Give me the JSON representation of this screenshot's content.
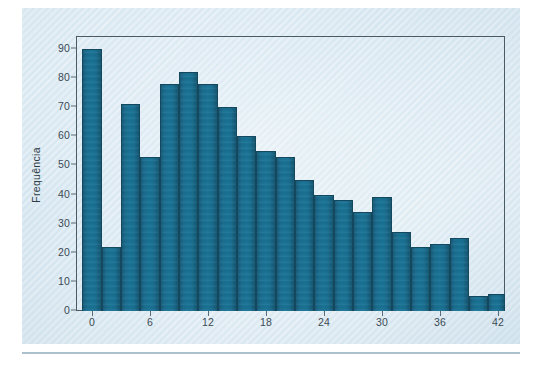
{
  "figure": {
    "background_color": "#e2edf4",
    "plot_border_color": "#4a5b66",
    "bar_color": "#1a7093",
    "bar_edge_color": "#14485e",
    "rule_line_color": "#9fb6c4"
  },
  "axes": {
    "y_axis_title": "Frequência",
    "y_ticks": [
      0,
      10,
      20,
      30,
      40,
      50,
      60,
      70,
      80,
      90
    ],
    "y_tick_labels": [
      "0",
      "10",
      "20",
      "30",
      "40",
      "50",
      "60",
      "70",
      "80",
      "90"
    ],
    "x_ticks": [
      0,
      6,
      12,
      18,
      24,
      30,
      36,
      42
    ],
    "x_tick_labels": [
      "0",
      "6",
      "12",
      "18",
      "24",
      "30",
      "36",
      "42"
    ]
  },
  "chart_data": {
    "type": "bar",
    "title": "",
    "subtitle": "",
    "xlabel": "",
    "ylabel": "Frequência",
    "xlim": [
      -1,
      45
    ],
    "ylim": [
      0,
      95
    ],
    "bin_width": 2,
    "grid": false,
    "legend": null,
    "categories": [
      "-1",
      "1",
      "3",
      "5",
      "7",
      "9",
      "11",
      "13",
      "15",
      "17",
      "19",
      "21",
      "23",
      "25",
      "27",
      "29",
      "31",
      "33",
      "35",
      "37",
      "39",
      "41",
      "43"
    ],
    "bin_starts": [
      -1,
      1,
      3,
      5,
      7,
      9,
      11,
      13,
      15,
      17,
      19,
      21,
      23,
      25,
      27,
      29,
      31,
      33,
      35,
      37,
      39,
      41,
      43
    ],
    "values": [
      90,
      22,
      71,
      53,
      78,
      82,
      78,
      70,
      60,
      55,
      53,
      45,
      40,
      38,
      34,
      39,
      27,
      22,
      23,
      25,
      5,
      6,
      6
    ],
    "tail_bins": {
      "bin_starts": [
        43,
        45
      ],
      "values": [
        0,
        6
      ]
    },
    "bars": [
      {
        "bin_start": -1,
        "bin_end": 1,
        "value": 90
      },
      {
        "bin_start": 1,
        "bin_end": 3,
        "value": 22
      },
      {
        "bin_start": 3,
        "bin_end": 5,
        "value": 71
      },
      {
        "bin_start": 5,
        "bin_end": 7,
        "value": 53
      },
      {
        "bin_start": 7,
        "bin_end": 9,
        "value": 78
      },
      {
        "bin_start": 9,
        "bin_end": 11,
        "value": 82
      },
      {
        "bin_start": 11,
        "bin_end": 13,
        "value": 78
      },
      {
        "bin_start": 13,
        "bin_end": 15,
        "value": 70
      },
      {
        "bin_start": 15,
        "bin_end": 17,
        "value": 60
      },
      {
        "bin_start": 17,
        "bin_end": 19,
        "value": 55
      },
      {
        "bin_start": 19,
        "bin_end": 21,
        "value": 53
      },
      {
        "bin_start": 21,
        "bin_end": 23,
        "value": 45
      },
      {
        "bin_start": 23,
        "bin_end": 25,
        "value": 40
      },
      {
        "bin_start": 25,
        "bin_end": 27,
        "value": 38
      },
      {
        "bin_start": 27,
        "bin_end": 29,
        "value": 34
      },
      {
        "bin_start": 29,
        "bin_end": 31,
        "value": 39
      },
      {
        "bin_start": 31,
        "bin_end": 33,
        "value": 27
      },
      {
        "bin_start": 33,
        "bin_end": 35,
        "value": 22
      },
      {
        "bin_start": 35,
        "bin_end": 37,
        "value": 23
      },
      {
        "bin_start": 37,
        "bin_end": 39,
        "value": 25
      },
      {
        "bin_start": 39,
        "bin_end": 41,
        "value": 5
      },
      {
        "bin_start": 41,
        "bin_end": 43,
        "value": 6
      },
      {
        "bin_start": 43,
        "bin_end": 45,
        "value": 6
      },
      {
        "bin_start": 45,
        "bin_end": 47,
        "value": 0
      },
      {
        "bin_start": 47,
        "bin_end": 49,
        "value": 6
      }
    ]
  }
}
